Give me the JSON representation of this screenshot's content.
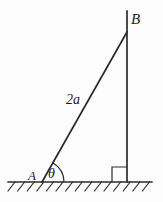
{
  "figure": {
    "background_color": "#fdfdfd",
    "stroke_color": "#2b2b2b",
    "labels": {
      "vertex_top": "B",
      "vertex_base": "A",
      "length_label": "2a",
      "angle_label": "θ"
    },
    "geometry": {
      "ground_line": {
        "x1": 8,
        "y1": 182,
        "x2": 152,
        "y2": 182
      },
      "vertical_line": {
        "x1": 127,
        "y1": 11,
        "x2": 127,
        "y2": 182
      },
      "hypotenuse": {
        "x1": 42,
        "y1": 182,
        "x2": 127,
        "y2": 32
      },
      "angle_arc": {
        "cx": 42,
        "cy": 182,
        "radius": 22
      },
      "right_angle_square": {
        "x": 112,
        "y": 167,
        "size": 15
      },
      "hatching": {
        "count": 15,
        "start_x": 8,
        "spacing": 9.6,
        "length": 9,
        "slant": "lower-left-to-upper-right"
      }
    }
  }
}
